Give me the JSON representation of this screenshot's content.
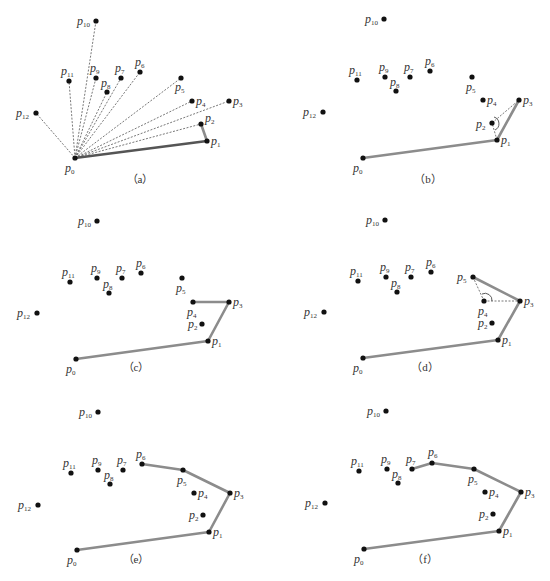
{
  "figure": {
    "point_names": [
      "p0",
      "p1",
      "p2",
      "p3",
      "p4",
      "p5",
      "p6",
      "p7",
      "p8",
      "p9",
      "p10",
      "p11",
      "p12"
    ],
    "colors": {
      "point": "#111111",
      "hull_edge": "#8c8c8c",
      "dashed": "#555555",
      "text": "#333333"
    },
    "panels": [
      {
        "id": "a",
        "caption": "（a）",
        "points": [
          [
            75,
            158
          ],
          [
            207,
            141
          ],
          [
            201,
            124
          ],
          [
            229,
            101
          ],
          [
            192,
            101
          ],
          [
            181,
            78
          ],
          [
            140,
            72
          ],
          [
            121,
            78
          ],
          [
            107,
            92
          ],
          [
            96,
            78
          ],
          [
            96,
            21
          ],
          [
            69,
            81
          ],
          [
            36,
            113
          ]
        ],
        "hull": [
          0,
          1,
          2
        ],
        "dashed_rays_from_p0": true,
        "caption_pos": [
          140,
          183
        ]
      },
      {
        "id": "b",
        "caption": "（b）",
        "points": [
          [
            363,
            158
          ],
          [
            497,
            140
          ],
          [
            492,
            123
          ],
          [
            519,
            100
          ],
          [
            483,
            100
          ],
          [
            472,
            77
          ],
          [
            430,
            71
          ],
          [
            410,
            77
          ],
          [
            396,
            91
          ],
          [
            385,
            77
          ],
          [
            384,
            19
          ],
          [
            357,
            80
          ],
          [
            323,
            112
          ]
        ],
        "hull": [
          0,
          1,
          3
        ],
        "dashed": [
          [
            1,
            2
          ],
          [
            2,
            3
          ]
        ],
        "angle_at": 2,
        "caption_pos": [
          428,
          183
        ]
      },
      {
        "id": "c",
        "caption": "（c）",
        "points": [
          [
            76,
            359
          ],
          [
            208,
            341
          ],
          [
            202,
            324
          ],
          [
            229,
            302
          ],
          [
            193,
            302
          ],
          [
            182,
            278
          ],
          [
            141,
            273
          ],
          [
            122,
            278
          ],
          [
            109,
            293
          ],
          [
            97,
            278
          ],
          [
            97,
            221
          ],
          [
            70,
            282
          ],
          [
            37,
            313
          ]
        ],
        "hull": [
          0,
          1,
          3,
          4
        ],
        "caption_pos": [
          136,
          371
        ]
      },
      {
        "id": "d",
        "caption": "（d）",
        "points": [
          [
            363,
            358
          ],
          [
            498,
            340
          ],
          [
            492,
            323
          ],
          [
            520,
            301
          ],
          [
            484,
            301
          ],
          [
            473,
            277
          ],
          [
            431,
            272
          ],
          [
            411,
            277
          ],
          [
            397,
            292
          ],
          [
            386,
            277
          ],
          [
            385,
            220
          ],
          [
            358,
            281
          ],
          [
            324,
            312
          ]
        ],
        "hull": [
          0,
          1,
          3,
          5
        ],
        "dashed": [
          [
            5,
            4
          ],
          [
            4,
            3
          ]
        ],
        "angle_at": 4,
        "caption_pos": [
          425,
          371
        ]
      },
      {
        "id": "e",
        "caption": "（e）",
        "points": [
          [
            77,
            550
          ],
          [
            209,
            532
          ],
          [
            203,
            515
          ],
          [
            230,
            493
          ],
          [
            194,
            493
          ],
          [
            183,
            470
          ],
          [
            142,
            464
          ],
          [
            123,
            470
          ],
          [
            110,
            484
          ],
          [
            98,
            470
          ],
          [
            98,
            412
          ],
          [
            71,
            473
          ],
          [
            38,
            505
          ]
        ],
        "hull": [
          0,
          1,
          3,
          5,
          6
        ],
        "caption_pos": [
          136,
          563
        ]
      },
      {
        "id": "f",
        "caption": "（f）",
        "points": [
          [
            364,
            549
          ],
          [
            499,
            531
          ],
          [
            493,
            514
          ],
          [
            521,
            492
          ],
          [
            485,
            492
          ],
          [
            474,
            469
          ],
          [
            432,
            463
          ],
          [
            412,
            469
          ],
          [
            398,
            483
          ],
          [
            387,
            469
          ],
          [
            386,
            411
          ],
          [
            359,
            471
          ],
          [
            325,
            503
          ]
        ],
        "hull": [
          0,
          1,
          3,
          5,
          6,
          7
        ],
        "caption_pos": [
          425,
          563
        ]
      }
    ]
  }
}
